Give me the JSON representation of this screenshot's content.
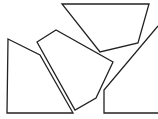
{
  "canvas": {
    "width": 158,
    "height": 119,
    "background": "#ffffff"
  },
  "stroke": {
    "color": "#222222",
    "width": 1.3
  },
  "shapes": [
    {
      "name": "left-pentagon",
      "points": "8,39 40,55 73,113 7,113"
    },
    {
      "name": "top-quadrilateral",
      "points": "62,4 149,4 138,43 100,52"
    },
    {
      "name": "middle-pentagon",
      "points": "37,42 56,30 113,62 96,98 75,110"
    },
    {
      "name": "right-partial-shape",
      "points": "158,26 104,90 104,113 158,113"
    }
  ]
}
